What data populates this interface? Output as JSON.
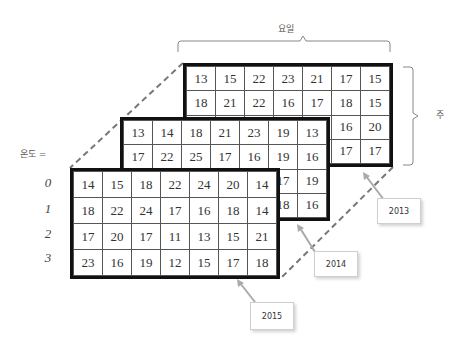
{
  "labels": {
    "days": "요일",
    "weeks": "주",
    "temperature": "온도 ="
  },
  "row_labels": [
    "0",
    "1",
    "2",
    "3"
  ],
  "grids": {
    "y2013": {
      "year": "2013",
      "rows": [
        [
          "13",
          "15",
          "22",
          "23",
          "21",
          "17",
          "15"
        ],
        [
          "18",
          "21",
          "22",
          "16",
          "17",
          "18",
          "15"
        ],
        [
          "",
          "",
          "",
          "",
          "",
          "16",
          "20"
        ],
        [
          "",
          "",
          "",
          "",
          "",
          "17",
          "17"
        ]
      ]
    },
    "y2014": {
      "year": "2014",
      "rows": [
        [
          "13",
          "14",
          "18",
          "21",
          "23",
          "19",
          "13"
        ],
        [
          "17",
          "22",
          "25",
          "17",
          "16",
          "19",
          "16"
        ],
        [
          "",
          "",
          "",
          "",
          "",
          "17",
          "19"
        ],
        [
          "",
          "",
          "",
          "",
          "",
          "18",
          "16"
        ]
      ]
    },
    "y2015": {
      "year": "2015",
      "rows": [
        [
          "14",
          "15",
          "18",
          "22",
          "24",
          "20",
          "14"
        ],
        [
          "18",
          "22",
          "24",
          "17",
          "16",
          "18",
          "14"
        ],
        [
          "17",
          "20",
          "17",
          "11",
          "13",
          "15",
          "21"
        ],
        [
          "23",
          "16",
          "19",
          "12",
          "15",
          "17",
          "18"
        ]
      ]
    }
  },
  "callouts": [
    "2013",
    "2014",
    "2015"
  ]
}
